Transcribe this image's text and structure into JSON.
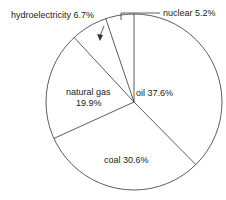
{
  "chart_data": {
    "type": "pie",
    "title": "",
    "categories": [
      "oil",
      "coal",
      "natural gas",
      "hydroelectricity",
      "nuclear"
    ],
    "values": [
      37.6,
      30.6,
      19.9,
      6.7,
      5.2
    ],
    "unit": "%",
    "start_angle": "12 o'clock, clockwise",
    "labels": {
      "oil": "oil   37.6%",
      "coal": "coal   30.6%",
      "gas_1": "natural gas",
      "gas_2": "19.9%",
      "hydro": "hydroelectricity   6.7%",
      "nuclear": "nuclear   5.2%"
    }
  }
}
